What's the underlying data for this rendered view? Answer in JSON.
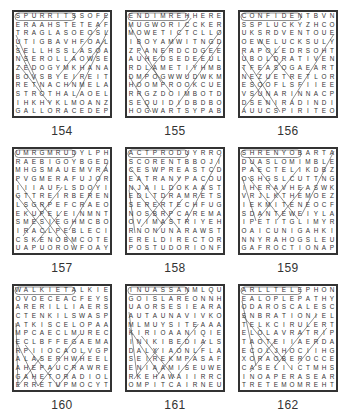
{
  "puzzles": [
    {
      "number": "154",
      "rows": [
        "SPURRITSSOFE",
        "ERAAHSTETEAF",
        "TRAGLASOEOSL",
        "UTIGBAVHFOAL",
        "SELLHSSLASOA",
        "NSEROLLAOWSE",
        "ZEDOGYMKHANA",
        "BOVSBYEIREIT",
        "RETNACHNMELA",
        "STROTHALAOEL",
        "IHKHYKLMOANZ",
        "GALLORACEDEP"
      ]
    },
    {
      "number": "155",
      "rows": [
        "ENDIMREHHERE",
        "MUGWORICCKER",
        "MOWETICTCLLO",
        "IBOYAMWITNGD",
        "ZPANERDCDGEE",
        "AUHEDSEDEEUL",
        "RDLAMETIYHMB",
        "DMPOGWWUDWKM",
        "HOOMPROOKCUE",
        "RRGZDOIMBOTD",
        "SEQUIDIDBDBO",
        "HOGWARTSYPAB"
      ]
    },
    {
      "number": "156",
      "rows": [
        "CONFIDENTBVN",
        "SSPLUCKYZHCO",
        "UKSRDVENTOUE",
        "OEWELUCKSULY",
        "RAPOLEDRSOHT",
        "UBOLDRATIVEN",
        "TFEASOGAEART",
        "NEZUETRETLOR",
        "ESOOFLSFIIEE",
        "VSUNARINNACP",
        "DSENIRADINDI",
        "AUUCSPIRITEO"
      ]
    },
    {
      "number": "157",
      "rows": [
        "UMRGMRUDYLPH",
        "RAEBIGOYBGED",
        "MHGSMAUEMVRA",
        "PVGMERAFUJOR",
        "IIIAUFLSDOYI",
        "GTTREIRBEREN",
        "LSGRPEFCRAEO",
        "EKUPELEINMNT",
        "SMESIEGHMCBO",
        "IRACLPEBLECI",
        "CSKENOBMCOTE",
        "UAPUOROWFOAY"
      ]
    },
    {
      "number": "158",
      "rows": [
        "ACTPRODUYRRO",
        "SCORENTBBOJI",
        "CESWPREASTCD",
        "EATRANYPACOU",
        "NJAILDOKAAST",
        "EDLTDRAMRETS",
        "SERERTECHFUG",
        "NOSBRPCAREMA",
        "OVIMASTRIYEH",
        "RNONUNARAWST",
        "ERELDIRECTOR",
        "POSTUDORIONF"
      ]
    },
    {
      "number": "159",
      "rows": [
        "SHRENYOBARTA",
        "DUASLOMIMBLE",
        "PAECTELIKDBZ",
        "OSHGSLCUTTNG",
        "IHERAVHEASWK",
        "VRJLKTHEMOEZ",
        "IEKMITENEOCF",
        "SDANTEWEIYLA",
        "IPETITGLIMYR",
        "OAICUNIGAHKI",
        "NNYRAHOGSLEU",
        "GAFROCTIONAP"
      ]
    },
    {
      "number": "160",
      "rows": [
        "WALKIETALKIE",
        "OVOECEACFEYS",
        "ARERILLIAERS",
        "CTENKILSWASP",
        "ATKISCELOPAA",
        "MPCAECLMUREC",
        "ECLBFFEGAEMA",
        "RPIIOCAOLVGP",
        "ALASERHWHEEL",
        "AHEPAUCRAWRE",
        "GAHETORADIOL",
        "ERRETUPMOCYT"
      ]
    },
    {
      "number": "161",
      "rows": [
        "INUASSANMLQU",
        "GOISLAREONNH",
        "UAORSESIEARA",
        "AUTAUNAVIVKO",
        "MLMUYSITEAAA",
        "KIRIOAANIQIE",
        "INIKIBEDIALS",
        "DALXIAONLFLA",
        "SEIREKMPASAF",
        "ENIAAMISEUWE",
        "RKEHAWAIIRRC",
        "OMPITCAIRNEU"
      ]
    },
    {
      "number": "162",
      "rows": [
        "ARLLTELEPHONE",
        "EALOPLEPATHY",
        "ODAROSCALESC",
        "SNBRATIONIEL",
        "TELKCIRULERT",
        "ELOLAVRATRIP",
        "TAOTEIIAERDA",
        "ECOLJHOCIIHG",
        "XORAOBEROCCE",
        "CASELIICTMHS",
        "INOAPERASEAR",
        "TRETEMOMREHT"
      ]
    }
  ]
}
